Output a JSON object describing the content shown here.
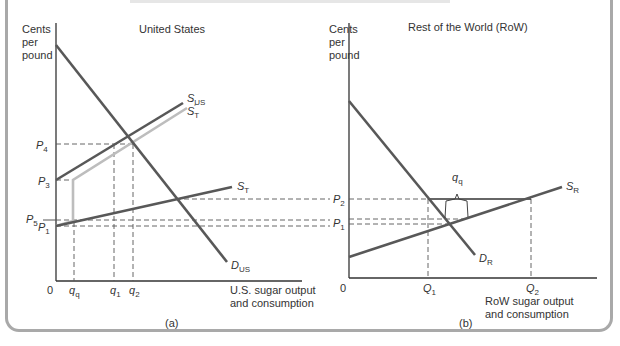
{
  "figure": {
    "colors": {
      "dark_line": "#585858",
      "light_line": "#bdbdbd",
      "axis": "#333333",
      "dash": "#555555",
      "frame": "#a9a9a9"
    },
    "panel_a": {
      "title": "United States",
      "caption": "(a)",
      "y_label": [
        "Cents",
        "per",
        "pound"
      ],
      "x_label": [
        "U.S. sugar output",
        "and consumption"
      ],
      "origin_label": "0",
      "price_labels": [
        {
          "name": "P",
          "sub": "4"
        },
        {
          "name": "P",
          "sub": "3"
        },
        {
          "name": "P",
          "sub": "5"
        },
        {
          "name": "P",
          "sub": "1"
        }
      ],
      "quantity_labels": [
        {
          "name": "q",
          "sub": "q"
        },
        {
          "name": "q",
          "sub": "1"
        },
        {
          "name": "q",
          "sub": "2"
        }
      ],
      "curves": [
        {
          "id": "D_US",
          "name": "D",
          "sub": "US"
        },
        {
          "id": "S_US",
          "name": "S",
          "sub": "US"
        },
        {
          "id": "S_T_prime",
          "name": "S",
          "sub": "T",
          "prime": "′"
        },
        {
          "id": "S_T",
          "name": "S",
          "sub": "T"
        }
      ]
    },
    "panel_b": {
      "title": "Rest of the World (RoW)",
      "caption": "(b)",
      "y_label": [
        "Cents",
        "per",
        "pound"
      ],
      "x_label": [
        "RoW sugar output",
        "and consumption"
      ],
      "origin_label": "0",
      "price_labels": [
        {
          "name": "P",
          "sub": "2"
        },
        {
          "name": "P",
          "sub": "1"
        }
      ],
      "quantity_labels": [
        {
          "name": "Q",
          "sub": "1"
        },
        {
          "name": "Q",
          "sub": "2"
        }
      ],
      "brace_label": {
        "name": "q",
        "sub": "q"
      },
      "curves": [
        {
          "id": "D_R",
          "name": "D",
          "sub": "R"
        },
        {
          "id": "S_R",
          "name": "S",
          "sub": "R"
        }
      ]
    }
  }
}
